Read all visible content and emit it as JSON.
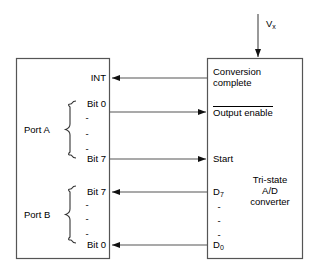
{
  "diagram": {
    "input_signal": {
      "label": "V",
      "subscript": "x",
      "name": "analog-input-vx"
    },
    "left_box": {
      "name": "microprocessor-port-box",
      "signals": [
        {
          "label": "INT",
          "name": "int"
        },
        {
          "label": "Bit 0",
          "name": "port-a-bit-0"
        },
        {
          "label": "Bit 7",
          "name": "port-a-bit-7"
        },
        {
          "label": "Bit 7",
          "name": "port-b-bit-7"
        },
        {
          "label": "Bit 0",
          "name": "port-b-bit-0"
        }
      ],
      "groups": [
        {
          "label": "Port A",
          "name": "port-a-group"
        },
        {
          "label": "Port B",
          "name": "port-b-group"
        }
      ],
      "ellipsis": "-"
    },
    "right_box": {
      "name": "adc-box",
      "title_lines": [
        "Tri-state",
        "A/D",
        "converter"
      ],
      "signals": [
        {
          "label_line1": "Conversion",
          "label_line2": "complete",
          "name": "conversion-complete"
        },
        {
          "label": "Output enable",
          "overline": true,
          "name": "output-enable"
        },
        {
          "label": "Start",
          "name": "start"
        },
        {
          "label": "D",
          "subscript": "7",
          "name": "data-bit-7"
        },
        {
          "label": "D",
          "subscript": "0",
          "name": "data-bit-0"
        }
      ],
      "ellipsis": "-"
    },
    "connections": [
      {
        "name": "conversion-complete-to-int",
        "from": "Conversion complete",
        "to": "INT",
        "direction": "right-to-left"
      },
      {
        "name": "bit0-to-output-enable",
        "from": "Port A Bit 0",
        "to": "Output enable",
        "direction": "left-to-right"
      },
      {
        "name": "bit7-to-start",
        "from": "Port A Bit 7",
        "to": "Start",
        "direction": "left-to-right"
      },
      {
        "name": "d7-to-portb-bit7",
        "from": "D7",
        "to": "Port B Bit 7",
        "direction": "right-to-left"
      },
      {
        "name": "d0-to-portb-bit0",
        "from": "D0",
        "to": "Port B Bit 0",
        "direction": "right-to-left"
      },
      {
        "name": "vx-into-adc",
        "from": "Vx",
        "to": "A/D converter",
        "direction": "top-down"
      }
    ],
    "colors": {
      "line": "#4d4d4d",
      "box_border": "#555555",
      "text": "#000000",
      "background": "#ffffff"
    }
  }
}
